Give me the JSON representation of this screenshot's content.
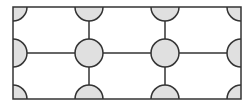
{
  "diagram": {
    "stroke_color": "#333333",
    "fill_color": "#e0e0e0",
    "background_color": "#ffffff",
    "rect": {
      "x": 13,
      "y": 7,
      "width": 228,
      "height": 92
    },
    "columns_x": [
      13,
      89,
      165,
      241
    ],
    "rows_y": [
      7,
      53,
      99
    ],
    "circle_radius": 14
  }
}
